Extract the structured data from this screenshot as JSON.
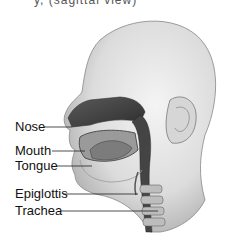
{
  "caption_partial": "y, (sagittal view)",
  "labels": [
    {
      "id": "nose",
      "text": "Nose"
    },
    {
      "id": "mouth",
      "text": "Mouth"
    },
    {
      "id": "tongue",
      "text": "Tongue"
    },
    {
      "id": "epiglottis",
      "text": "Epiglottis"
    },
    {
      "id": "trachea",
      "text": "Trachea"
    }
  ]
}
